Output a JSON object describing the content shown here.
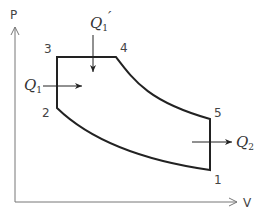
{
  "diagram": {
    "type": "PV diagram (Sabathe / dual combustion cycle)",
    "axes": {
      "y_label": "P",
      "x_label": "V"
    },
    "points": [
      {
        "id": "1",
        "label": "1"
      },
      {
        "id": "2",
        "label": "2"
      },
      {
        "id": "3",
        "label": "3"
      },
      {
        "id": "4",
        "label": "4"
      },
      {
        "id": "5",
        "label": "5"
      }
    ],
    "heat_flows": {
      "q1_prime": {
        "base": "Q",
        "sub": "1",
        "prime": "′"
      },
      "q1": {
        "base": "Q",
        "sub": "1"
      },
      "q2": {
        "base": "Q",
        "sub": "2"
      }
    },
    "colors": {
      "cycle_line": "#222222",
      "axis_line": "#777777",
      "label": "#444444"
    }
  }
}
